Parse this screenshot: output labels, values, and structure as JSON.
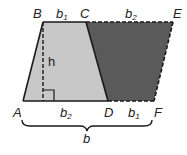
{
  "diagram": {
    "title": "",
    "colors": {
      "trapezoid_fill": "#c8c8c8",
      "rotated_copy_fill": "#5a5a5a",
      "stroke": "#1a1a1a",
      "background": "#ffffff"
    },
    "points": {
      "A": {
        "label": "A",
        "x": 23,
        "y": 101
      },
      "B": {
        "label": "B",
        "x": 43,
        "y": 22
      },
      "C": {
        "label": "C",
        "x": 86,
        "y": 22
      },
      "D": {
        "label": "D",
        "x": 108,
        "y": 101
      },
      "E": {
        "label": "E",
        "x": 173,
        "y": 22
      },
      "F": {
        "label": "F",
        "x": 154,
        "y": 101
      }
    },
    "segment_labels": {
      "BC": {
        "base": "b",
        "sub": "1"
      },
      "CE": {
        "base": "b",
        "sub": "2"
      },
      "AD": {
        "base": "b",
        "sub": "2"
      },
      "DF": {
        "base": "b",
        "sub": "1"
      },
      "height": "h",
      "total": "b"
    }
  }
}
